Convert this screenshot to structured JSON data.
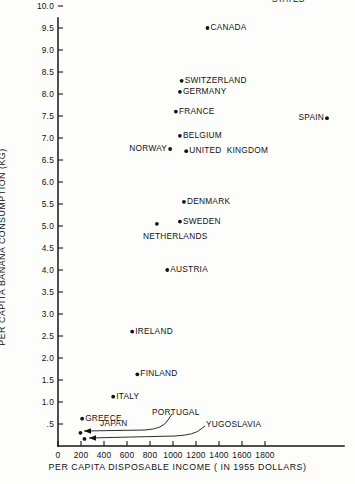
{
  "chart_data": {
    "type": "scatter",
    "title": "",
    "xlabel": "PER CAPITA  DISPOSABLE  INCOME  ( IN 1955  DOLLARS)",
    "ylabel": "PER  CAPITA  BANANA  CONSUMPTION  (KG)",
    "xlim": [
      0,
      1950
    ],
    "ylim": [
      0,
      10.6
    ],
    "grid": false,
    "legend": "none",
    "xticks": [
      0,
      200,
      400,
      600,
      800,
      1000,
      1200,
      1400,
      1600,
      1800
    ],
    "xtick_labels": [
      "0",
      "200",
      "400",
      "600",
      "800",
      "1000",
      "1200",
      "1400",
      "1600",
      "1800"
    ],
    "yticks": [
      0.5,
      1.0,
      1.5,
      2.0,
      2.5,
      3.0,
      3.5,
      4.0,
      4.5,
      5.0,
      5.5,
      6.0,
      6.5,
      7.0,
      7.5,
      8.0,
      8.5,
      9.0,
      9.5,
      10.0
    ],
    "ytick_labels": [
      ".5",
      "1.0",
      "1.5",
      "2.0",
      "2.5",
      "3.0",
      "3.5",
      "4.0",
      "4.5",
      "5.0",
      "5.5",
      "6.0",
      "6.5",
      "7.0",
      "7.5",
      "8.0",
      "8.5",
      "9.0",
      "9.5",
      "10.0"
    ],
    "points": [
      {
        "name": "UNITED\n  STATES",
        "label": "UNITED STATES",
        "x": 1790,
        "y": 10.25,
        "side": "right",
        "clipped_x": false
      },
      {
        "name": "CANADA",
        "label": "CANADA",
        "x": 1300,
        "y": 9.5,
        "side": "right",
        "clipped_x": false
      },
      {
        "name": "SWITZERLAND",
        "label": "SWITZERLAND",
        "x": 1075,
        "y": 8.3,
        "side": "right",
        "clipped_x": false
      },
      {
        "name": "GERMANY",
        "label": "GERMANY",
        "x": 1060,
        "y": 8.05,
        "side": "right",
        "clipped_x": false
      },
      {
        "name": "FRANCE",
        "label": "FRANCE",
        "x": 1025,
        "y": 7.6,
        "side": "right",
        "clipped_x": false
      },
      {
        "name": "SPAIN",
        "label": "SPAIN",
        "x": 2340,
        "y": 7.45,
        "side": "left",
        "clipped_x": true
      },
      {
        "name": "BELGIUM",
        "label": "BELGIUM",
        "x": 1060,
        "y": 7.05,
        "side": "right",
        "clipped_x": false
      },
      {
        "name": "NORWAY",
        "label": "NORWAY",
        "x": 975,
        "y": 6.75,
        "side": "left",
        "clipped_x": false
      },
      {
        "name": "UNITED  KINGDOM",
        "label": "UNITED KINGDOM",
        "x": 1115,
        "y": 6.7,
        "side": "right",
        "clipped_x": false
      },
      {
        "name": "DENMARK",
        "label": "DENMARK",
        "x": 1095,
        "y": 5.55,
        "side": "right",
        "clipped_x": false
      },
      {
        "name": "SWEDEN",
        "label": "SWEDEN",
        "x": 1060,
        "y": 5.1,
        "side": "right",
        "clipped_x": false
      },
      {
        "name": "NETHERLANDS",
        "label": "NETHERLANDS",
        "x": 860,
        "y": 5.05,
        "side": "below",
        "clipped_x": false
      },
      {
        "name": "AUSTRIA",
        "label": "AUSTRIA",
        "x": 950,
        "y": 4.0,
        "side": "right",
        "clipped_x": false
      },
      {
        "name": "IRELAND",
        "label": "IRELAND",
        "x": 645,
        "y": 2.6,
        "side": "right",
        "clipped_x": false
      },
      {
        "name": "FINLAND",
        "label": "FINLAND",
        "x": 690,
        "y": 1.63,
        "side": "right",
        "clipped_x": false
      },
      {
        "name": "ITALY",
        "label": "ITALY",
        "x": 480,
        "y": 1.12,
        "side": "right",
        "clipped_x": false
      },
      {
        "name": "GREECE",
        "label": "GREECE",
        "x": 210,
        "y": 0.62,
        "side": "right",
        "clipped_x": false
      },
      {
        "name": "PORTUGAL",
        "label": "PORTUGAL",
        "x": 195,
        "y": 0.3,
        "side": "leader",
        "clipped_x": false
      },
      {
        "name": "YUGOSLAVIA",
        "label": "YUGOSLAVIA",
        "x": 230,
        "y": 0.16,
        "side": "leader",
        "clipped_x": false
      }
    ],
    "annotations": [
      {
        "text": "JAPAN",
        "note": "label text near bottom-left cluster"
      },
      {
        "text": "PORTUGAL",
        "note": "leader line to point at approx x=195, y=0.30"
      },
      {
        "text": "YUGOSLAVIA",
        "note": "leader line to point at approx x=230, y=0.16"
      }
    ]
  },
  "axis": {
    "x_title": "PER CAPITA  DISPOSABLE  INCOME  ( IN 1955  DOLLARS)",
    "y_title": "PER  CAPITA  BANANA  CONSUMPTION  (KG)"
  },
  "labels": {
    "united_states": "UNITED\nSTATES",
    "canada": "CANADA",
    "switzerland": "SWITZERLAND",
    "germany": "GERMANY",
    "france": "FRANCE",
    "spain": "SPAIN",
    "belgium": "BELGIUM",
    "norway": "NORWAY",
    "united_kingdom": "UNITED  KINGDOM",
    "denmark": "DENMARK",
    "sweden": "SWEDEN",
    "netherlands": "NETHERLANDS",
    "austria": "AUSTRIA",
    "ireland": "IRELAND",
    "finland": "FINLAND",
    "italy": "ITALY",
    "greece": "GREECE",
    "japan": "JAPAN",
    "portugal": "PORTUGAL",
    "yugoslavia": "YUGOSLAVIA"
  }
}
